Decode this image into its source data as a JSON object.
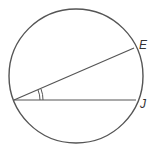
{
  "diagram": {
    "type": "circle with inscribed angle",
    "circle": {
      "cx": 76,
      "cy": 76,
      "r": 67
    },
    "vertex": {
      "x": 14,
      "y": 100
    },
    "points": [
      {
        "label": "E",
        "x": 134,
        "y": 48,
        "label_x": 139,
        "label_y": 39
      },
      {
        "label": "J",
        "x": 136,
        "y": 100,
        "label_x": 140,
        "label_y": 98
      }
    ],
    "angle_marks": 2,
    "stroke_color": "#555555"
  }
}
